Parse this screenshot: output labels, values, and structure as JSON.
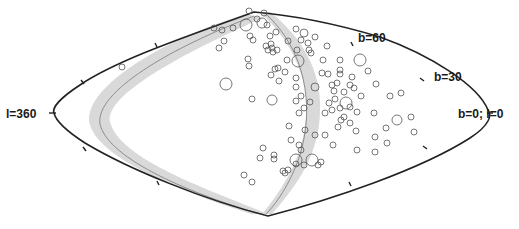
{
  "figure": {
    "type": "sky-map",
    "projection": "Aitoff/Hammer-like all-sky (galactic coordinates)",
    "labels": {
      "l360": "l=360",
      "b60": "b=60",
      "b30": "b=30",
      "b0l0": "b=0; l=0"
    },
    "colors": {
      "outline": "#222222",
      "band": "#d9d9d9",
      "band_center": "#7a7a7a",
      "marker": "#555555",
      "background": "#ffffff"
    },
    "markers": [
      [
        122,
        67,
        3
      ],
      [
        214,
        28,
        3
      ],
      [
        219,
        48,
        3
      ],
      [
        222,
        30,
        3
      ],
      [
        224,
        41,
        3
      ],
      [
        233,
        28,
        3
      ],
      [
        226,
        84,
        6
      ],
      [
        246,
        25,
        6
      ],
      [
        249,
        11,
        3
      ],
      [
        250,
        36,
        3
      ],
      [
        253,
        40,
        3
      ],
      [
        248,
        59,
        3
      ],
      [
        249,
        66,
        3
      ],
      [
        252,
        99,
        3
      ],
      [
        257,
        19,
        3
      ],
      [
        262,
        23,
        5
      ],
      [
        264,
        13,
        3
      ],
      [
        266,
        46,
        3
      ],
      [
        267,
        25,
        3
      ],
      [
        268,
        50,
        3
      ],
      [
        270,
        36,
        3
      ],
      [
        271,
        44,
        3
      ],
      [
        272,
        48,
        3
      ],
      [
        273,
        52,
        3
      ],
      [
        277,
        50,
        3
      ],
      [
        276,
        32,
        3
      ],
      [
        275,
        69,
        3
      ],
      [
        271,
        75,
        3
      ],
      [
        272,
        100,
        5
      ],
      [
        278,
        68,
        3
      ],
      [
        279,
        81,
        3
      ],
      [
        285,
        72,
        3
      ],
      [
        287,
        60,
        3
      ],
      [
        288,
        41,
        3
      ],
      [
        296,
        29,
        3
      ],
      [
        298,
        61,
        6
      ],
      [
        304,
        33,
        4
      ],
      [
        297,
        50,
        3
      ],
      [
        301,
        40,
        3
      ],
      [
        308,
        43,
        3
      ],
      [
        309,
        50,
        3
      ],
      [
        296,
        78,
        3
      ],
      [
        296,
        87,
        3
      ],
      [
        301,
        96,
        3
      ],
      [
        296,
        101,
        3
      ],
      [
        299,
        113,
        3
      ],
      [
        304,
        108,
        3
      ],
      [
        310,
        102,
        3
      ],
      [
        311,
        53,
        3
      ],
      [
        315,
        37,
        3
      ],
      [
        315,
        87,
        4
      ],
      [
        322,
        73,
        3
      ],
      [
        323,
        60,
        3
      ],
      [
        328,
        74,
        3
      ],
      [
        332,
        85,
        3
      ],
      [
        337,
        83,
        3
      ],
      [
        340,
        74,
        3
      ],
      [
        340,
        60,
        3
      ],
      [
        340,
        70,
        3
      ],
      [
        334,
        91,
        3
      ],
      [
        335,
        99,
        3
      ],
      [
        329,
        103,
        3
      ],
      [
        325,
        113,
        3
      ],
      [
        332,
        110,
        3
      ],
      [
        340,
        108,
        3
      ],
      [
        344,
        117,
        3
      ],
      [
        346,
        103,
        6
      ],
      [
        350,
        107,
        3
      ],
      [
        357,
        112,
        3
      ],
      [
        344,
        92,
        3
      ],
      [
        350,
        85,
        3
      ],
      [
        352,
        77,
        3
      ],
      [
        338,
        127,
        3
      ],
      [
        350,
        123,
        3
      ],
      [
        360,
        60,
        6
      ],
      [
        361,
        96,
        3
      ],
      [
        354,
        88,
        3
      ],
      [
        368,
        71,
        3
      ],
      [
        327,
        46,
        3
      ],
      [
        325,
        135,
        3
      ],
      [
        333,
        145,
        3
      ],
      [
        315,
        135,
        3
      ],
      [
        305,
        130,
        3
      ],
      [
        299,
        145,
        3
      ],
      [
        301,
        150,
        3
      ],
      [
        296,
        160,
        6
      ],
      [
        296,
        164,
        3
      ],
      [
        304,
        165,
        3
      ],
      [
        312,
        160,
        6
      ],
      [
        318,
        165,
        3
      ],
      [
        321,
        162,
        3
      ],
      [
        288,
        170,
        3
      ],
      [
        274,
        155,
        3
      ],
      [
        274,
        159,
        3
      ],
      [
        289,
        126,
        3
      ],
      [
        291,
        140,
        3
      ],
      [
        244,
        175,
        3
      ],
      [
        252,
        182,
        3
      ],
      [
        260,
        158,
        3
      ],
      [
        263,
        148,
        3
      ],
      [
        283,
        171,
        3
      ],
      [
        285,
        173,
        3
      ],
      [
        357,
        150,
        3
      ],
      [
        375,
        152,
        3
      ],
      [
        387,
        143,
        3
      ],
      [
        397,
        120,
        5
      ],
      [
        386,
        128,
        3
      ],
      [
        411,
        117,
        3
      ],
      [
        414,
        132,
        3
      ],
      [
        390,
        96,
        3
      ],
      [
        401,
        93,
        3
      ],
      [
        375,
        137,
        3
      ],
      [
        374,
        113,
        3
      ],
      [
        376,
        84,
        3
      ],
      [
        341,
        120,
        3
      ],
      [
        356,
        131,
        3
      ]
    ]
  }
}
